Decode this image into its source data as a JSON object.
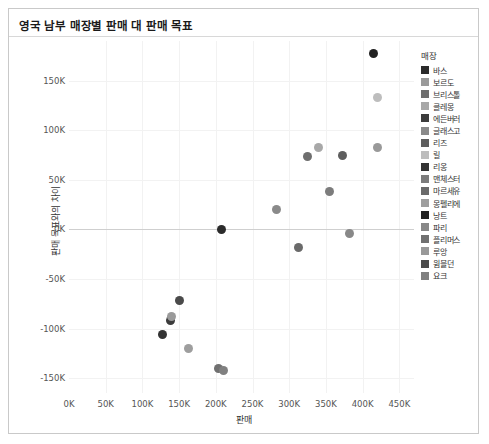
{
  "card": {
    "title": "영국 남부 매장별 판매 대 판매 목표"
  },
  "legend": {
    "title": "매장",
    "items": [
      {
        "label": "바스",
        "color": "#2b2b2b"
      },
      {
        "label": "보르도",
        "color": "#9a9a9a"
      },
      {
        "label": "브리스톨",
        "color": "#6e6e6e"
      },
      {
        "label": "클레몽",
        "color": "#a8a8a8"
      },
      {
        "label": "에든버러",
        "color": "#3c3c3c"
      },
      {
        "label": "글래스고",
        "color": "#8a8a8a"
      },
      {
        "label": "리즈",
        "color": "#5e5e5e"
      },
      {
        "label": "릴",
        "color": "#bdbdbd"
      },
      {
        "label": "리옹",
        "color": "#333333"
      },
      {
        "label": "맨체스터",
        "color": "#7c7c7c"
      },
      {
        "label": "마르세유",
        "color": "#6a6a6a"
      },
      {
        "label": "몽펠리에",
        "color": "#9e9e9e"
      },
      {
        "label": "낭트",
        "color": "#222222"
      },
      {
        "label": "파리",
        "color": "#888888"
      },
      {
        "label": "플리머스",
        "color": "#707070"
      },
      {
        "label": "루앙",
        "color": "#999999"
      },
      {
        "label": "윔블던",
        "color": "#4a4a4a"
      },
      {
        "label": "요크",
        "color": "#808080"
      }
    ]
  },
  "chart_data": {
    "type": "scatter",
    "title": "영국 남부 매장별 판매 대 판매 목표",
    "xlabel": "판매",
    "ylabel": "판매 목표와의 차이",
    "xlim": [
      0,
      470000
    ],
    "ylim": [
      -165000,
      190000
    ],
    "grid": true,
    "legend_position": "right",
    "legend_title": "매장",
    "xticks": [
      "0K",
      "50K",
      "100K",
      "150K",
      "200K",
      "250K",
      "300K",
      "350K",
      "400K",
      "450K"
    ],
    "xtick_values": [
      0,
      50000,
      100000,
      150000,
      200000,
      250000,
      300000,
      350000,
      400000,
      450000
    ],
    "yticks": [
      "150K",
      "100K",
      "50K",
      "0K",
      "-50K",
      "-100K",
      "-150K"
    ],
    "ytick_values": [
      150000,
      100000,
      50000,
      0,
      -50000,
      -100000,
      -150000
    ],
    "points": [
      {
        "name": "낭트",
        "x": 415000,
        "y": 177000,
        "color": "#222222"
      },
      {
        "name": "릴",
        "x": 420000,
        "y": 133000,
        "color": "#bdbdbd"
      },
      {
        "name": "클레몽",
        "x": 340000,
        "y": 83000,
        "color": "#a8a8a8"
      },
      {
        "name": "브리스톨",
        "x": 325000,
        "y": 74000,
        "color": "#6e6e6e"
      },
      {
        "name": "리즈",
        "x": 373000,
        "y": 75000,
        "color": "#5e5e5e"
      },
      {
        "name": "루앙",
        "x": 420000,
        "y": 83000,
        "color": "#999999"
      },
      {
        "name": "맨체스터",
        "x": 355000,
        "y": 38000,
        "color": "#7c7c7c"
      },
      {
        "name": "글래스고",
        "x": 283000,
        "y": 20000,
        "color": "#8a8a8a"
      },
      {
        "name": "바스",
        "x": 208000,
        "y": 0,
        "color": "#2b2b2b"
      },
      {
        "name": "파리",
        "x": 382000,
        "y": -4000,
        "color": "#888888"
      },
      {
        "name": "마르세유",
        "x": 313000,
        "y": -18000,
        "color": "#6a6a6a"
      },
      {
        "name": "윔블던",
        "x": 150000,
        "y": -72000,
        "color": "#4a4a4a"
      },
      {
        "name": "에든버러",
        "x": 138000,
        "y": -92000,
        "color": "#3c3c3c"
      },
      {
        "name": "보르도",
        "x": 140000,
        "y": -88000,
        "color": "#9a9a9a"
      },
      {
        "name": "리옹",
        "x": 128000,
        "y": -106000,
        "color": "#333333"
      },
      {
        "name": "몽펠리에",
        "x": 163000,
        "y": -120000,
        "color": "#9e9e9e"
      },
      {
        "name": "플리머스",
        "x": 203000,
        "y": -140000,
        "color": "#707070"
      },
      {
        "name": "요크",
        "x": 210000,
        "y": -142000,
        "color": "#808080"
      }
    ]
  }
}
